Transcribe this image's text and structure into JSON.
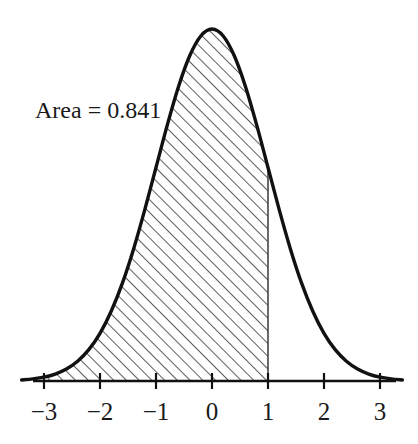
{
  "figure": {
    "name": "standard-normal-distribution-shaded-area",
    "background_color": "#ffffff",
    "curve_color": "#111111",
    "axis_color": "#111111",
    "hatch_color": "#333333",
    "boundary_line_color": "#444444"
  },
  "annotation": {
    "area_label": "Area = 0.841",
    "x_px": 35,
    "y_px": 118
  },
  "axis": {
    "tick_labels": [
      "−3",
      "−2",
      "−1",
      "0",
      "1",
      "2",
      "3"
    ],
    "tick_values": [
      -3,
      -2,
      -1,
      0,
      1,
      2,
      3
    ]
  },
  "chart_data": {
    "type": "area",
    "title": "",
    "subtitle": "",
    "xlabel": "",
    "ylabel": "",
    "xlim": [
      -3.4,
      3.4
    ],
    "ylim": [
      0,
      0.42
    ],
    "grid": false,
    "legend": null,
    "distribution": "standard normal (mean 0, sd 1)",
    "curve": {
      "name": "standard-normal-pdf",
      "x": [
        -3.4,
        -3.2,
        -3.0,
        -2.8,
        -2.6,
        -2.4,
        -2.2,
        -2.0,
        -1.8,
        -1.6,
        -1.4,
        -1.2,
        -1.0,
        -0.8,
        -0.6,
        -0.4,
        -0.2,
        0.0,
        0.2,
        0.4,
        0.6,
        0.8,
        1.0,
        1.2,
        1.4,
        1.6,
        1.8,
        2.0,
        2.2,
        2.4,
        2.6,
        2.8,
        3.0,
        3.2,
        3.4
      ],
      "y": [
        0.0012,
        0.0024,
        0.0044,
        0.0079,
        0.0136,
        0.0224,
        0.0355,
        0.054,
        0.079,
        0.1109,
        0.1497,
        0.1942,
        0.242,
        0.2897,
        0.3332,
        0.3683,
        0.391,
        0.3989,
        0.391,
        0.3683,
        0.3332,
        0.2897,
        0.242,
        0.1942,
        0.1497,
        0.1109,
        0.079,
        0.054,
        0.0355,
        0.0224,
        0.0136,
        0.0079,
        0.0044,
        0.0024,
        0.0012
      ]
    },
    "shaded_region": {
      "name": "cumulative-area-left-of-one",
      "from": -3.4,
      "to": 1.0,
      "fill": "diagonal-hatch",
      "area_value": 0.841,
      "area_label": "Area = 0.841"
    },
    "boundary_line": {
      "x": 1.0,
      "label": "1"
    },
    "xticks": [
      -3,
      -2,
      -1,
      0,
      1,
      2,
      3
    ],
    "xticklabels": [
      "−3",
      "−2",
      "−1",
      "0",
      "1",
      "2",
      "3"
    ],
    "yticks": [],
    "yticklabels": [],
    "annotations": [
      {
        "text": "Area = 0.841",
        "x": -2.9,
        "y": 0.335
      }
    ]
  }
}
